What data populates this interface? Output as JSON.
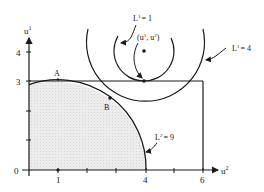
{
  "diagram": {
    "axes": {
      "x_label": "u",
      "x_label_sup": "2",
      "y_label": "u",
      "y_label_sup": "1",
      "x_ticks": [
        {
          "value": 1,
          "label": "1"
        },
        {
          "value": 2,
          "label": ""
        },
        {
          "value": 3,
          "label": ""
        },
        {
          "value": 4,
          "label": "4"
        },
        {
          "value": 5,
          "label": ""
        },
        {
          "value": 6,
          "label": "6"
        }
      ],
      "y_ticks": [
        {
          "value": 0,
          "label": "0"
        },
        {
          "value": 1,
          "label": ""
        },
        {
          "value": 2,
          "label": ""
        },
        {
          "value": 3,
          "label": "3"
        },
        {
          "value": 4,
          "label": "4"
        }
      ]
    },
    "points": {
      "A": "A",
      "B": "B",
      "bliss_label_open": "(u",
      "bliss_sup1": "1",
      "bliss_mid": ", u",
      "bliss_sup2": "2",
      "bliss_close": ")"
    },
    "curves": {
      "L1_small": {
        "name": "L",
        "sup": "1",
        "eq": "= 1"
      },
      "L1_large": {
        "name": "L",
        "sup": "1",
        "eq": "= 4"
      },
      "L2": {
        "name": "L",
        "sup": "2",
        "eq": "= 9"
      }
    },
    "colors": {
      "line": "#1a1a1a",
      "shade": "#e6e6e6"
    }
  }
}
